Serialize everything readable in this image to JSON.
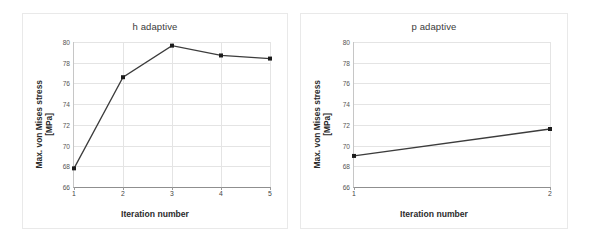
{
  "figure": {
    "background": "#ffffff",
    "line_color": "#3c3c3c",
    "marker_color": "#1c1c1c",
    "grid_color": "#e4e4e4"
  },
  "charts": [
    {
      "id": "h-adaptive",
      "title": "h adaptive",
      "xlabel": "Iteration number",
      "ylabel_line1": "Max. von Mises stress",
      "ylabel_line2": "[MPa]",
      "xticks": [
        "1",
        "2",
        "3",
        "4",
        "5"
      ],
      "yticks": [
        "66",
        "68",
        "70",
        "72",
        "74",
        "76",
        "78",
        "80"
      ]
    },
    {
      "id": "p-adaptive",
      "title": "p adaptive",
      "xlabel": "Iteration number",
      "ylabel_line1": "Max. von Mises stress",
      "ylabel_line2": "[MPa]",
      "xticks": [
        "1",
        "2"
      ],
      "yticks": [
        "66",
        "68",
        "70",
        "72",
        "74",
        "76",
        "78",
        "80"
      ]
    }
  ],
  "chart_data": [
    {
      "type": "line",
      "title": "h adaptive",
      "xlabel": "Iteration number",
      "ylabel": "Max. von Mises stress [MPa]",
      "x": [
        1,
        2,
        3,
        4,
        5
      ],
      "values": [
        67.8,
        76.6,
        79.65,
        78.7,
        78.4
      ],
      "xlim": [
        1,
        5
      ],
      "ylim": [
        66,
        80
      ],
      "xticks": [
        1,
        2,
        3,
        4,
        5
      ],
      "yticks": [
        66,
        68,
        70,
        72,
        74,
        76,
        78,
        80
      ],
      "grid": true,
      "legend": false,
      "marker": "square",
      "line_color": "#3c3c3c"
    },
    {
      "type": "line",
      "title": "p adaptive",
      "xlabel": "Iteration number",
      "ylabel": "Max. von Mises stress [MPa]",
      "x": [
        1,
        2
      ],
      "values": [
        69.0,
        71.6
      ],
      "xlim": [
        1,
        2
      ],
      "ylim": [
        66,
        80
      ],
      "xticks": [
        1,
        2
      ],
      "yticks": [
        66,
        68,
        70,
        72,
        74,
        76,
        78,
        80
      ],
      "grid": true,
      "legend": false,
      "marker": "square",
      "line_color": "#3c3c3c"
    }
  ]
}
